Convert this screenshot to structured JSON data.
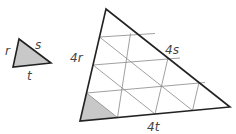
{
  "diagram": {
    "small_triangle": {
      "fill": "#c8c8c8",
      "labels": {
        "left": "r",
        "hypotenuse": "s",
        "bottom": "t"
      }
    },
    "large_triangle": {
      "grid_divisions": 4,
      "shaded_fill": "#c8c8c8",
      "labels": {
        "left": "4r",
        "hypotenuse": "4s",
        "bottom": "4t"
      }
    },
    "colors": {
      "stroke": "#222222",
      "grid": "#888888"
    }
  }
}
